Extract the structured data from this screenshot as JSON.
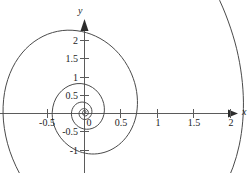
{
  "chart_data": {
    "type": "line",
    "title": "",
    "subtitle": "",
    "xlabel": "x",
    "ylabel": "y",
    "xlim": [
      -1.15,
      2.3
    ],
    "ylim": [
      -1.55,
      2.35
    ],
    "grid": false,
    "legend": null,
    "annotations": [],
    "axes": {
      "x_ticks": [
        -0.5,
        0.5,
        1,
        1.5,
        2
      ],
      "x_tick_labels": [
        "-0.5",
        "0.5",
        "1",
        "1.5",
        "2"
      ],
      "y_ticks": [
        -1,
        -0.5,
        0.5,
        1,
        1.5,
        2
      ],
      "y_tick_labels": [
        "-1",
        "-0.5",
        "0.5",
        "1",
        "1.5",
        "2"
      ],
      "origin_label": "0",
      "x_arrow": true,
      "y_arrow": true
    },
    "series": [
      {
        "name": "spiral",
        "description": "outward counterclockwise spiral from origin",
        "color": "#4a4a4a",
        "x_axis_crossings_positive": [
          0.02,
          0.1,
          0.42,
          2.02
        ],
        "x_axis_crossings_negative": [
          -0.04,
          -0.2,
          -0.93
        ],
        "y_axis_crossings_positive": [
          0.03,
          0.15,
          0.62
        ],
        "y_axis_crossings_negative": [
          -0.05,
          -0.28,
          -1.32
        ],
        "endpoint": [
          1.4,
          2.1
        ],
        "points": [
          [
            0.0,
            0.0
          ],
          [
            0.011,
            0.006
          ],
          [
            0.018,
            0.017
          ],
          [
            0.019,
            0.03
          ],
          [
            0.013,
            0.04
          ],
          [
            0.002,
            0.044
          ],
          [
            -0.011,
            0.04
          ],
          [
            -0.022,
            0.029
          ],
          [
            -0.027,
            0.013
          ],
          [
            -0.025,
            -0.005
          ],
          [
            -0.016,
            -0.021
          ],
          [
            -0.001,
            -0.031
          ],
          [
            0.017,
            -0.033
          ],
          [
            0.035,
            -0.026
          ],
          [
            0.048,
            -0.01
          ],
          [
            0.053,
            0.011
          ],
          [
            0.048,
            0.034
          ],
          [
            0.034,
            0.053
          ],
          [
            0.012,
            0.065
          ],
          [
            -0.014,
            0.067
          ],
          [
            -0.04,
            0.058
          ],
          [
            -0.061,
            0.039
          ],
          [
            -0.073,
            0.013
          ],
          [
            -0.073,
            -0.017
          ],
          [
            -0.061,
            -0.046
          ],
          [
            -0.039,
            -0.069
          ],
          [
            -0.009,
            -0.081
          ],
          [
            0.025,
            -0.079
          ],
          [
            0.058,
            -0.062
          ],
          [
            0.085,
            -0.032
          ],
          [
            0.1,
            0.008
          ],
          [
            0.099,
            0.053
          ],
          [
            0.081,
            0.096
          ],
          [
            0.048,
            0.131
          ],
          [
            0.003,
            0.152
          ],
          [
            -0.047,
            0.156
          ],
          [
            -0.097,
            0.14
          ],
          [
            -0.14,
            0.105
          ],
          [
            -0.169,
            0.054
          ],
          [
            -0.179,
            -0.008
          ],
          [
            -0.167,
            -0.073
          ],
          [
            -0.133,
            -0.134
          ],
          [
            -0.079,
            -0.183
          ],
          [
            -0.011,
            -0.211
          ],
          [
            0.065,
            -0.214
          ],
          [
            0.141,
            -0.189
          ],
          [
            0.206,
            -0.136
          ],
          [
            0.252,
            -0.059
          ],
          [
            0.272,
            0.035
          ],
          [
            0.263,
            0.138
          ],
          [
            0.222,
            0.238
          ],
          [
            0.153,
            0.323
          ],
          [
            0.06,
            0.383
          ],
          [
            -0.047,
            0.41
          ],
          [
            -0.159,
            0.399
          ],
          [
            -0.265,
            0.35
          ],
          [
            -0.354,
            0.266
          ],
          [
            -0.416,
            0.152
          ],
          [
            -0.442,
            0.018
          ],
          [
            -0.427,
            -0.126
          ],
          [
            -0.37,
            -0.267
          ],
          [
            -0.273,
            -0.393
          ],
          [
            -0.142,
            -0.489
          ],
          [
            0.013,
            -0.545
          ],
          [
            0.182,
            -0.551
          ],
          [
            0.35,
            -0.503
          ],
          [
            0.503,
            -0.4
          ],
          [
            0.625,
            -0.245
          ],
          [
            0.703,
            -0.048
          ],
          [
            0.725,
            0.18
          ],
          [
            0.687,
            0.422
          ],
          [
            0.586,
            0.658
          ],
          [
            0.425,
            0.868
          ],
          [
            0.212,
            1.029
          ],
          [
            -0.037,
            1.123
          ],
          [
            -0.305,
            1.136
          ],
          [
            -0.568,
            1.058
          ],
          [
            -0.804,
            0.886
          ],
          [
            -0.987,
            0.625
          ],
          [
            -1.095,
            0.288
          ],
          [
            -1.11,
            -0.102
          ],
          [
            -1.022,
            -0.518
          ],
          [
            -0.829,
            -0.926
          ],
          [
            -0.539,
            -1.292
          ],
          [
            -0.167,
            -1.58
          ],
          [
            0.263,
            -1.76
          ],
          [
            0.722,
            -1.806
          ],
          [
            1.176,
            -1.7
          ],
          [
            1.586,
            -1.432
          ],
          [
            1.914,
            -1.005
          ],
          [
            2.12,
            -0.434
          ],
          [
            2.175,
            0.244
          ],
          [
            2.06,
            0.979
          ],
          [
            1.77,
            1.705
          ],
          [
            1.4,
            2.1
          ]
        ]
      }
    ]
  }
}
